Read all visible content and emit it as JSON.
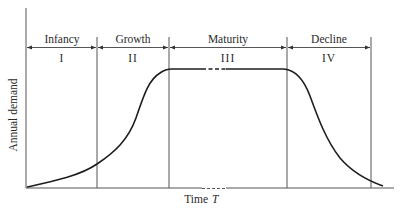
{
  "diagram": {
    "y_axis_label": "Annual demand",
    "x_axis_label": "Time",
    "x_axis_symbol": "T",
    "stages": [
      {
        "name": "Infancy",
        "numeral": "I"
      },
      {
        "name": "Growth",
        "numeral": "II"
      },
      {
        "name": "Maturity",
        "numeral": "III"
      },
      {
        "name": "Decline",
        "numeral": "IV"
      }
    ],
    "curve_description": "S-shaped rise through infancy and growth, flat plateau during maturity (with a dashed break indicating an extended period), then decay to near zero during decline",
    "line_color": "#1e1e1e",
    "axis_color": "#555555"
  }
}
